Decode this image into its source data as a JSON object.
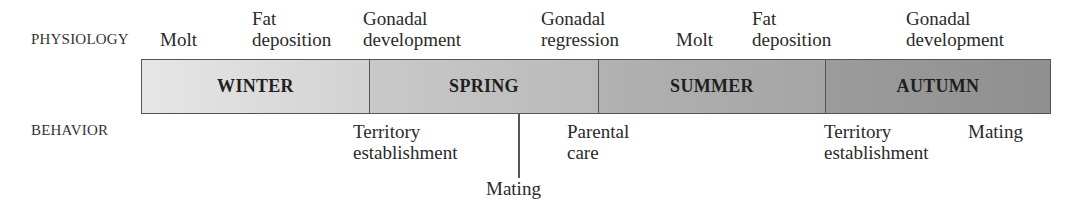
{
  "diagram": {
    "type": "annual-cycle-timeline",
    "row_labels": {
      "physiology": "PHYSIOLOGY",
      "behavior": "BEHAVIOR"
    },
    "seasons": [
      {
        "label": "WINTER",
        "color_left": "#e4e4e4",
        "color_right": "#d0d0d0"
      },
      {
        "label": "SPRING",
        "color_left": "#c8c8c8",
        "color_right": "#b8b8b8"
      },
      {
        "label": "SUMMER",
        "color_left": "#b0b0b0",
        "color_right": "#a4a4a4"
      },
      {
        "label": "AUTUMN",
        "color_left": "#9a9a9a",
        "color_right": "#8e8e8e"
      }
    ],
    "physiology_events": [
      {
        "line1": "",
        "line2": "Molt"
      },
      {
        "line1": "Fat",
        "line2": "deposition"
      },
      {
        "line1": "Gonadal",
        "line2": "development"
      },
      {
        "line1": "Gonadal",
        "line2": "regression"
      },
      {
        "line1": "",
        "line2": "Molt"
      },
      {
        "line1": "Fat",
        "line2": "deposition"
      },
      {
        "line1": "Gonadal",
        "line2": "development"
      }
    ],
    "behavior_events": [
      {
        "line1": "Territory",
        "line2": "establishment"
      },
      {
        "line1": "Mating",
        "line2": ""
      },
      {
        "line1": "Parental",
        "line2": "care"
      },
      {
        "line1": "Territory",
        "line2": "establishment"
      },
      {
        "line1": "Mating",
        "line2": ""
      }
    ]
  }
}
